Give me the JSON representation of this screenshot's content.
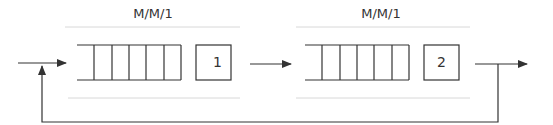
{
  "diagram": {
    "stations": [
      {
        "type_label": "M/M/1",
        "server_label": "1",
        "queue_slots": 6
      },
      {
        "type_label": "M/M/1",
        "server_label": "2",
        "queue_slots": 6
      }
    ],
    "edges": [
      {
        "from": "external-input",
        "to": "station-1"
      },
      {
        "from": "station-1",
        "to": "station-2"
      },
      {
        "from": "station-2",
        "to": "external-output"
      },
      {
        "from": "station-2",
        "to": "station-1",
        "kind": "feedback"
      }
    ],
    "colors": {
      "line": "#333333",
      "guide": "#d8d8d8"
    }
  }
}
